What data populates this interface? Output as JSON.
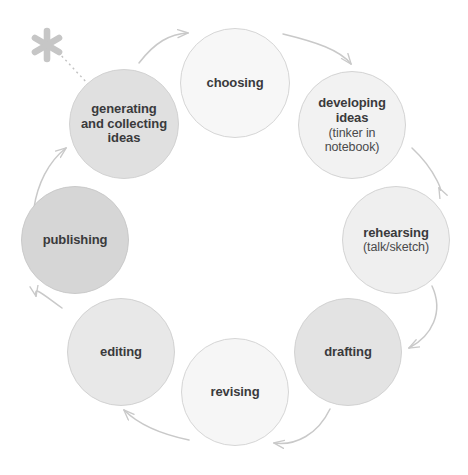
{
  "diagram": {
    "background_color": "#ffffff",
    "text_color": "#3a3a3c",
    "arrow_color": "#c9c9c9",
    "asterisk": {
      "icon": "asterisk-icon",
      "color": "#c6c6c6",
      "connector": "dotted-line"
    },
    "nodes": [
      {
        "id": "generating",
        "label": "generating\nand collecting\nideas",
        "lines": [
          "generating",
          "and collecting",
          "ideas"
        ],
        "sub": "",
        "cx": 124,
        "cy": 124,
        "r": 55,
        "fill": "#e0e0e0",
        "stroke": "#d2d2d2"
      },
      {
        "id": "choosing",
        "label": "choosing",
        "lines": [
          "choosing"
        ],
        "sub": "",
        "cx": 235,
        "cy": 83,
        "r": 55,
        "fill": "#f7f7f7",
        "stroke": "#d6d6d6"
      },
      {
        "id": "developing-ideas",
        "label": "developing\nideas",
        "lines": [
          "developing",
          "ideas"
        ],
        "sub": "(tinker in\nnotebook)",
        "sub_lines": [
          "(tinker in",
          "notebook)"
        ],
        "cx": 352,
        "cy": 125,
        "r": 54,
        "fill": "#f2f2f2",
        "stroke": "#d4d4d4"
      },
      {
        "id": "rehearsing",
        "label": "rehearsing",
        "lines": [
          "rehearsing"
        ],
        "sub": "(talk/sketch)",
        "sub_lines": [
          "(talk/sketch)"
        ],
        "cx": 396,
        "cy": 240,
        "r": 54,
        "fill": "#efefef",
        "stroke": "#d4d4d4"
      },
      {
        "id": "drafting",
        "label": "drafting",
        "lines": [
          "drafting"
        ],
        "sub": "",
        "cx": 348,
        "cy": 352,
        "r": 54,
        "fill": "#e3e3e3",
        "stroke": "#d2d2d2"
      },
      {
        "id": "revising",
        "label": "revising",
        "lines": [
          "revising"
        ],
        "sub": "",
        "cx": 235,
        "cy": 392,
        "r": 54,
        "fill": "#f6f6f6",
        "stroke": "#d6d6d6"
      },
      {
        "id": "editing",
        "label": "editing",
        "lines": [
          "editing"
        ],
        "sub": "",
        "cx": 121,
        "cy": 352,
        "r": 54,
        "fill": "#e8e8e8",
        "stroke": "#d2d2d2"
      },
      {
        "id": "publishing",
        "label": "publishing",
        "lines": [
          "publishing"
        ],
        "sub": "",
        "cx": 75,
        "cy": 240,
        "r": 54,
        "fill": "#d6d6d6",
        "stroke": "#cacaca"
      }
    ],
    "arrows": [
      {
        "from": "publishing",
        "to": "generating"
      },
      {
        "from": "generating",
        "to": "choosing"
      },
      {
        "from": "choosing",
        "to": "developing-ideas"
      },
      {
        "from": "developing-ideas",
        "to": "rehearsing"
      },
      {
        "from": "rehearsing",
        "to": "drafting"
      },
      {
        "from": "drafting",
        "to": "revising"
      },
      {
        "from": "revising",
        "to": "editing"
      },
      {
        "from": "editing",
        "to": "publishing"
      }
    ]
  }
}
